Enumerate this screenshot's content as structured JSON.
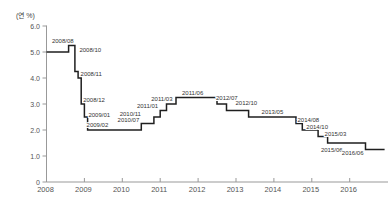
{
  "chart_data": {
    "type": "line",
    "subtype": "step",
    "title": "",
    "xlabel": "",
    "ylabel": "(연 %)",
    "ylim": [
      0,
      6.0
    ],
    "xlim": [
      2008,
      2016.92
    ],
    "grid": false,
    "legend": "none",
    "ytick_labels": [
      "0",
      "1.0",
      "2.0",
      "3.0",
      "4.0",
      "5.0",
      "6.0"
    ],
    "ytick_values": [
      0,
      1,
      2,
      3,
      4,
      5,
      6
    ],
    "xtick_labels": [
      "2008",
      "2009",
      "2010",
      "2011",
      "2012",
      "2013",
      "2014",
      "2015",
      "2016"
    ],
    "xtick_values": [
      2008,
      2009,
      2010,
      2011,
      2012,
      2013,
      2014,
      2015,
      2016
    ],
    "series_name": "기준금리",
    "start": {
      "date": "2008/01",
      "value": 5.0
    },
    "points": [
      {
        "date": "2008/08",
        "label": "2008/08",
        "value": 5.25
      },
      {
        "date": "2008/10",
        "label": "2008/10",
        "value": 4.25
      },
      {
        "date": "2008/11",
        "label": "2008/11",
        "value": 4.0
      },
      {
        "date": "2008/12",
        "label": "2008/12",
        "value": 3.0
      },
      {
        "date": "2009/01",
        "label": "2009/01",
        "value": 2.5
      },
      {
        "date": "2009/02",
        "label": "2009/02",
        "value": 2.0
      },
      {
        "date": "2010/07",
        "label": "2010/07",
        "value": 2.25
      },
      {
        "date": "2010/11",
        "label": "2010/11",
        "value": 2.5
      },
      {
        "date": "2011/01",
        "label": "2011/01",
        "value": 2.75
      },
      {
        "date": "2011/03",
        "label": "2011/03",
        "value": 3.0
      },
      {
        "date": "2011/06",
        "label": "2011/06",
        "value": 3.25
      },
      {
        "date": "2012/07",
        "label": "2012/07",
        "value": 3.0
      },
      {
        "date": "2012/10",
        "label": "2012/10",
        "value": 2.75
      },
      {
        "date": "2013/05",
        "label": "2013/05",
        "value": 2.5
      },
      {
        "date": "2014/08",
        "label": "2014/08",
        "value": 2.25
      },
      {
        "date": "2014/10",
        "label": "2014/10",
        "value": 2.0
      },
      {
        "date": "2015/03",
        "label": "2015/03",
        "value": 1.75
      },
      {
        "date": "2015/06",
        "label": "2015/06",
        "value": 1.5
      },
      {
        "date": "2016/06",
        "label": "2016/06",
        "value": 1.25
      }
    ],
    "colors": {
      "line": "#1f1f1f",
      "axis": "#999999",
      "tick_label": "#555555",
      "annotation": "#333333",
      "background": "#ffffff"
    }
  }
}
